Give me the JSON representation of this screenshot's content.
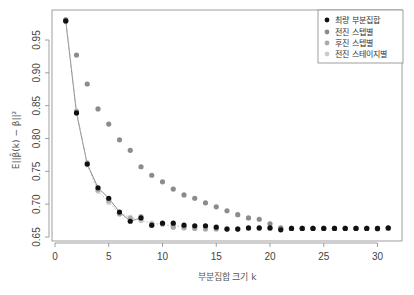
{
  "chart_data": {
    "type": "scatter",
    "title": "",
    "xlabel": "부분집합 크기 k",
    "ylabel": "E||β̂(k) − β||²",
    "xlim": [
      0,
      32
    ],
    "ylim": [
      0.645,
      0.985
    ],
    "xticks": [
      0,
      5,
      10,
      15,
      20,
      25,
      30
    ],
    "xtick_labels": [
      "0",
      "5",
      "10",
      "15",
      "20",
      "25",
      "30"
    ],
    "yticks": [
      0.65,
      0.7,
      0.75,
      0.8,
      0.85,
      0.9,
      0.95
    ],
    "ytick_labels": [
      "0.65",
      "0.70",
      "0.75",
      "0.80",
      "0.85",
      "0.90",
      "0.95"
    ],
    "grid": false,
    "legend_position": "top-right",
    "x": [
      1,
      2,
      3,
      4,
      5,
      6,
      7,
      8,
      9,
      10,
      11,
      12,
      13,
      14,
      15,
      16,
      17,
      18,
      19,
      20,
      21,
      22,
      23,
      24,
      25,
      26,
      27,
      28,
      29,
      30,
      31
    ],
    "series": [
      {
        "name": "최량 부분집합",
        "color": "#111111",
        "values": [
          0.979,
          0.839,
          0.761,
          0.725,
          0.709,
          0.688,
          0.674,
          0.679,
          0.668,
          0.671,
          0.671,
          0.668,
          0.667,
          0.667,
          0.665,
          0.662,
          0.662,
          0.664,
          0.664,
          0.664,
          0.661,
          0.663,
          0.663,
          0.663,
          0.663,
          0.663,
          0.663,
          0.663,
          0.663,
          0.663,
          0.664
        ]
      },
      {
        "name": "전진 스텝별",
        "color": "#8c8c8c",
        "values": [
          0.979,
          0.927,
          0.883,
          0.845,
          0.822,
          0.798,
          0.782,
          0.757,
          0.744,
          0.734,
          0.723,
          0.714,
          0.709,
          0.702,
          0.696,
          0.69,
          0.684,
          0.679,
          0.677,
          0.67,
          0.664,
          0.663,
          0.663,
          0.663,
          0.663,
          0.663,
          0.663,
          0.663,
          0.663,
          0.663,
          0.663
        ]
      },
      {
        "name": "후진 스텝별",
        "color": "#aaaaaa",
        "values": [
          0.981,
          0.841,
          0.763,
          0.722,
          0.706,
          0.685,
          0.678,
          0.681,
          0.668,
          0.67,
          0.665,
          0.664,
          0.663,
          0.662,
          0.662,
          0.662,
          0.662,
          0.663,
          0.663,
          0.663,
          0.662,
          0.663,
          0.663,
          0.663,
          0.663,
          0.663,
          0.663,
          0.663,
          0.663,
          0.662,
          0.663
        ]
      },
      {
        "name": "전진 스테이지별",
        "color": "#cccccc",
        "values": [
          0.981,
          0.842,
          0.76,
          0.72,
          0.703,
          0.686,
          0.68,
          0.675,
          0.671,
          0.669,
          0.667,
          0.666,
          0.665,
          0.664,
          0.664,
          0.663,
          0.663,
          0.663,
          0.663,
          0.663,
          0.663,
          0.663,
          0.663,
          0.663,
          0.663,
          0.663,
          0.663,
          0.663,
          0.663,
          0.663,
          0.663
        ]
      }
    ],
    "fitted_curves": [
      {
        "name": "최량 부분집합 (실선)",
        "color": "#555555",
        "style": "solid",
        "x_range": [
          1,
          8
        ]
      },
      {
        "name": "전진 스테이지별 (점선)",
        "color": "#bbbbbb",
        "style": "dotted",
        "x_range": [
          1,
          12
        ]
      }
    ]
  },
  "legend": {
    "items": [
      {
        "label": "최량 부분집합",
        "color": "#111111"
      },
      {
        "label": "전진 스텝별",
        "color": "#8c8c8c"
      },
      {
        "label": "후진 스텝별",
        "color": "#aaaaaa"
      },
      {
        "label": "전진 스테이지별",
        "color": "#cccccc"
      }
    ]
  },
  "axes": {
    "x_title": "부분집합 크기 k",
    "y_title": "E||β̂(k) − β||²"
  }
}
